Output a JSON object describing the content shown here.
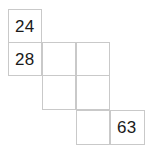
{
  "figure": {
    "type": "grid-puzzle",
    "background_color": "#ffffff",
    "border_color": "#c9c9c9",
    "text_color": "#1a1a1a",
    "columns": 4,
    "rows": 4,
    "cell_width": 34,
    "cell_height": 34,
    "origin_x": 8,
    "origin_y": 9,
    "cells": [
      {
        "name": "cell-r1c1",
        "row": 1,
        "col": 1,
        "x": 8,
        "y": 9,
        "w": 34,
        "h": 34,
        "value": "24"
      },
      {
        "name": "cell-r2c1",
        "row": 2,
        "col": 1,
        "x": 8,
        "y": 42,
        "w": 34,
        "h": 34,
        "value": "28"
      },
      {
        "name": "cell-r2c2",
        "row": 2,
        "col": 2,
        "x": 42,
        "y": 42,
        "w": 34,
        "h": 34,
        "value": ""
      },
      {
        "name": "cell-r2c3",
        "row": 2,
        "col": 3,
        "x": 76,
        "y": 42,
        "w": 34,
        "h": 34,
        "value": ""
      },
      {
        "name": "cell-r3c2",
        "row": 3,
        "col": 2,
        "x": 42,
        "y": 75,
        "w": 34,
        "h": 35,
        "value": ""
      },
      {
        "name": "cell-r3c3",
        "row": 3,
        "col": 3,
        "x": 76,
        "y": 75,
        "w": 34,
        "h": 35,
        "value": ""
      },
      {
        "name": "cell-r4c3",
        "row": 4,
        "col": 3,
        "x": 76,
        "y": 110,
        "w": 34,
        "h": 35,
        "value": ""
      },
      {
        "name": "cell-r4c4",
        "row": 4,
        "col": 4,
        "x": 110,
        "y": 110,
        "w": 35,
        "h": 35,
        "value": "63"
      }
    ]
  }
}
